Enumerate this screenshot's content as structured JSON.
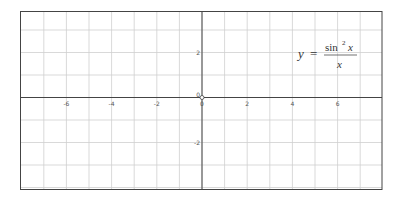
{
  "chart_data": {
    "type": "line",
    "title": "",
    "annotation": {
      "lhs": "y",
      "equals": "=",
      "numerator": "sin² x",
      "num_base": "sin",
      "num_exp": "2",
      "num_var": "x",
      "denominator": "x"
    },
    "function": "sin^2(x)/x",
    "series": [],
    "xlabel": "",
    "ylabel": "",
    "xlim": [
      -8,
      8
    ],
    "ylim": [
      -4.1,
      3.8
    ],
    "x_ticks": [
      -6,
      -4,
      -2,
      0,
      2,
      4,
      6
    ],
    "x_tick_labels": [
      "-6",
      "-4",
      "-2",
      "0",
      "2",
      "4",
      "6"
    ],
    "y_ticks": [
      2,
      0,
      -2
    ],
    "y_tick_labels": [
      "2",
      "0",
      "-2"
    ],
    "grid": true,
    "grid_step": 1,
    "origin_marker": "open-circle",
    "colors": {
      "grid": "#cfcfcf",
      "axis": "#444444",
      "border": "#444444",
      "text": "#555555"
    }
  }
}
